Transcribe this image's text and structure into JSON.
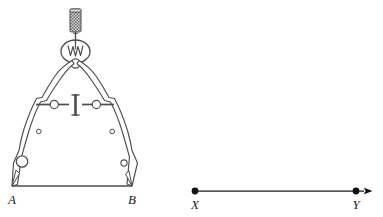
{
  "figure": {
    "background_color": "#ffffff",
    "stroke_color": "#4d4d4d",
    "dark_stroke_color": "#1a1a1a",
    "width": 383,
    "height": 217
  },
  "compass": {
    "name": "drawing-compass",
    "handle": {
      "label": "knurled-handle",
      "texture": "crosshatch",
      "fill_color": "#b3b3b3"
    },
    "hinge": {
      "label": "pivot-hinge",
      "spring": "w-spring"
    },
    "crossbar": {
      "label": "adjustment-crossbar",
      "center_bar": "vertical-adjustment-bar"
    },
    "legs": [
      "left-leg",
      "right-leg"
    ],
    "tips": [
      "point-a-tip",
      "point-b-tip"
    ]
  },
  "segment_ab": {
    "name": "segment-ab",
    "start_label": "A",
    "end_label": "B",
    "start_x": 12,
    "end_x": 132,
    "y": 186
  },
  "ray_xy": {
    "name": "ray-xy",
    "start_label": "X",
    "end_label": "Y",
    "start_x": 195,
    "end_x": 356,
    "y": 191,
    "arrow": "right-arrowhead",
    "point_color": "#111111"
  }
}
